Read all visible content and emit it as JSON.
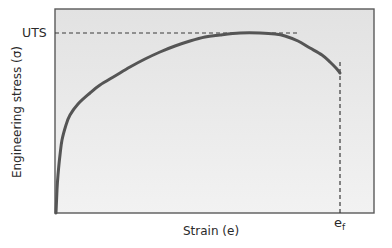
{
  "diagram": {
    "type": "stress-strain curve",
    "x_axis_label": "Strain (e)",
    "y_axis_label": "Engineering stress (σ)",
    "uts_label": "UTS",
    "fracture_label_base": "e",
    "fracture_label_sub": "f",
    "colors": {
      "plot_background": "#e6e6e6",
      "plot_border": "#5a5a5a",
      "curve": "#555555",
      "dashed_lines": "#3a3a3a",
      "text": "#2a2a2a"
    },
    "plot_area": {
      "left": 55,
      "top": 9,
      "right": 374,
      "bottom": 213
    },
    "curve_points": [
      [
        56,
        213
      ],
      [
        57,
        190
      ],
      [
        58,
        175
      ],
      [
        60,
        155
      ],
      [
        62,
        140
      ],
      [
        66,
        125
      ],
      [
        70,
        115
      ],
      [
        78,
        104
      ],
      [
        90,
        93
      ],
      [
        100,
        85
      ],
      [
        115,
        76
      ],
      [
        130,
        67
      ],
      [
        145,
        59
      ],
      [
        160,
        52
      ],
      [
        175,
        46
      ],
      [
        190,
        41
      ],
      [
        205,
        37
      ],
      [
        220,
        35
      ],
      [
        240,
        33
      ],
      [
        260,
        33
      ],
      [
        275,
        34
      ],
      [
        285,
        36
      ],
      [
        298,
        41
      ],
      [
        310,
        48
      ],
      [
        322,
        55
      ],
      [
        330,
        62
      ],
      [
        336,
        68
      ],
      [
        340,
        73
      ]
    ],
    "uts_line": {
      "y": 33,
      "x_start": 55,
      "x_end": 300
    },
    "fracture_line": {
      "x": 340,
      "y_start": 62,
      "y_end": 213
    }
  }
}
